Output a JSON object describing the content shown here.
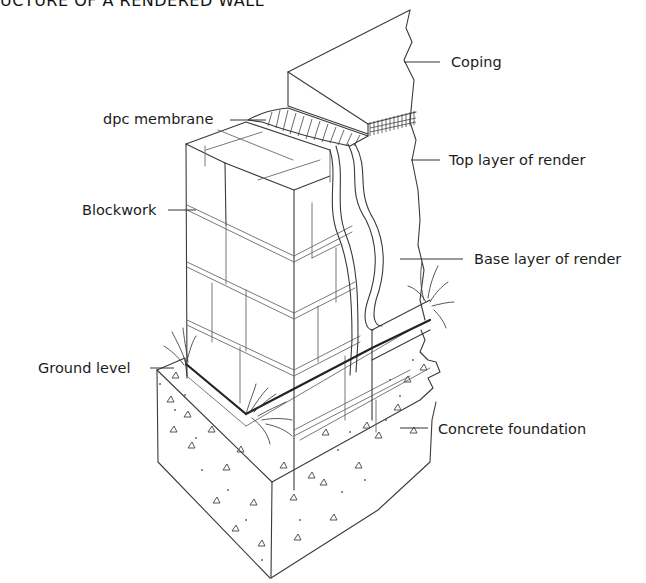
{
  "title": "UCTURE OF A RENDERED WALL",
  "labels": {
    "coping": "Coping",
    "dpc_membrane": "dpc membrane",
    "top_layer": "Top layer of render",
    "blockwork": "Blockwork",
    "base_layer": "Base layer of render",
    "ground_level": "Ground level",
    "concrete_foundation": "Concrete foundation"
  },
  "colors": {
    "background": "#ffffff",
    "line": "#3a3a3a",
    "text": "#1c1c1c"
  }
}
